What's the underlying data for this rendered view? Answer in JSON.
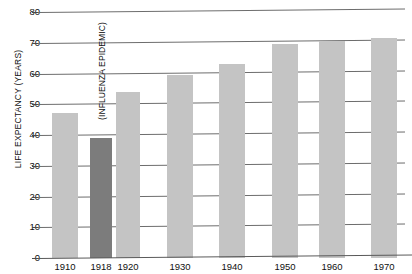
{
  "chart_data": {
    "type": "bar",
    "title": "",
    "subtitle": "",
    "xlabel": "",
    "ylabel": "LIFE EXPECTANCY (YEARS)",
    "categories": [
      "1910",
      "1918",
      "1920",
      "1930",
      "1940",
      "1950",
      "1960",
      "1970"
    ],
    "values": [
      47,
      39,
      54,
      59.5,
      63,
      69.5,
      70.5,
      71.5
    ],
    "ylim": [
      0,
      80
    ],
    "yticks": [
      0,
      10,
      20,
      30,
      40,
      50,
      60,
      70,
      80
    ],
    "ytick_labels": [
      "0",
      "10",
      "20",
      "30",
      "40",
      "50",
      "60",
      "70",
      "80"
    ],
    "grid": true,
    "legend": "none",
    "bar_colors": [
      "#c4c4c4",
      "#7c7c7c",
      "#c4c4c4",
      "#c4c4c4",
      "#c4c4c4",
      "#c4c4c4",
      "#c4c4c4",
      "#c4c4c4"
    ],
    "highlight_category": "1918",
    "annotations": [
      {
        "text": "(INFLUENZA EPIDEMIC)",
        "category": "1918",
        "orientation": "vertical"
      }
    ]
  },
  "colors": {
    "bar_light": "#c4c4c4",
    "bar_dark": "#7c7c7c",
    "gridline": "#6d6d6d",
    "axis": "#5a5a5a",
    "text": "#111111",
    "background": "#ffffff"
  }
}
